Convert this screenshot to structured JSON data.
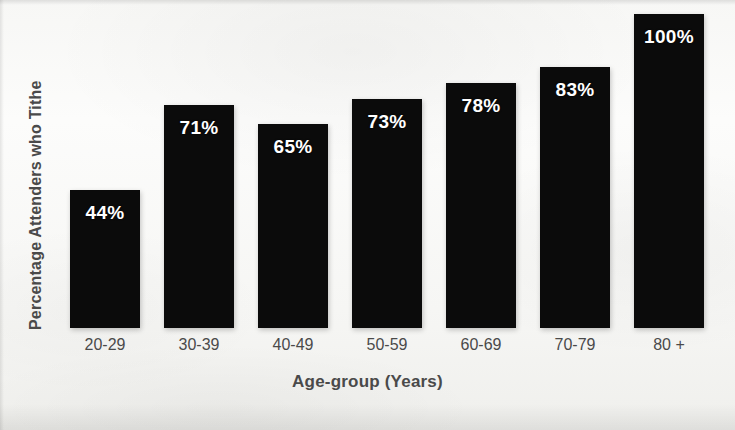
{
  "chart_data": {
    "type": "bar",
    "title": "",
    "xlabel": "Age-group (Years)",
    "ylabel": "Percentage Attenders who Tithe",
    "categories": [
      "20-29",
      "30-39",
      "40-49",
      "50-59",
      "60-69",
      "70-79",
      "80 +"
    ],
    "values": [
      44,
      71,
      65,
      73,
      78,
      83,
      100
    ],
    "value_labels": [
      "44%",
      "71%",
      "65%",
      "73%",
      "78%",
      "83%",
      "100%"
    ],
    "ylim": [
      0,
      100
    ],
    "grid": false,
    "legend": null,
    "axis_visible": false,
    "tick_labels_y": [],
    "bar_color": "#0b0b0b",
    "label_color": "#ffffff",
    "axis_text_color": "#4a4a4a",
    "background_color": "#f7f7f5"
  }
}
